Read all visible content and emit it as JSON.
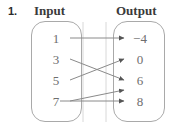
{
  "problem": {
    "number": "1."
  },
  "headings": {
    "input": "Input",
    "output": "Output"
  },
  "diagram": {
    "type": "mapping-diagram",
    "input_values": [
      "1",
      "3",
      "5",
      "7"
    ],
    "output_values": [
      "−4",
      "0",
      "6",
      "8"
    ],
    "mappings": [
      {
        "from": "1",
        "to": "−4"
      },
      {
        "from": "3",
        "to": "6"
      },
      {
        "from": "5",
        "to": "0"
      },
      {
        "from": "7",
        "to": "6"
      },
      {
        "from": "7",
        "to": "8"
      }
    ],
    "colors": {
      "line": "#8a8a8a",
      "text": "#6e6e6e",
      "heading": "#3a3a3a",
      "oval_border": "#a9a9a9",
      "background": "#ffffff"
    }
  }
}
